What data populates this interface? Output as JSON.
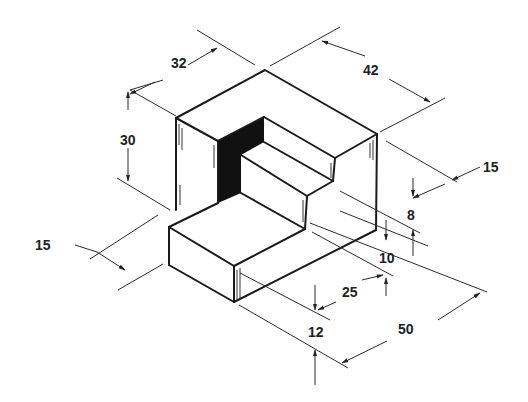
{
  "diagram": {
    "type": "isometric-technical-drawing",
    "colors": {
      "line": "#1a1a1a",
      "shadow_face": "#111111",
      "background": "#ffffff"
    },
    "dimensions": {
      "d32": "32",
      "d42": "42",
      "d30": "30",
      "d15_right": "15",
      "d8": "8",
      "d10": "10",
      "d15_left": "15",
      "d25": "25",
      "d12": "12",
      "d50": "50"
    }
  }
}
